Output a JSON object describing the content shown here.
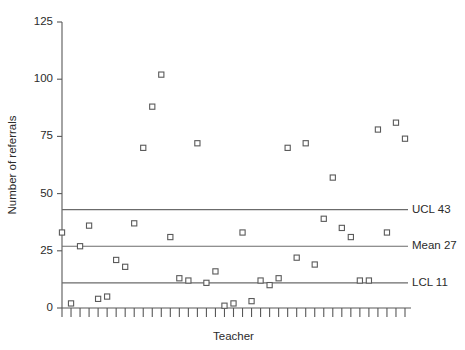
{
  "chart_data": {
    "type": "scatter",
    "title": "",
    "xlabel": "Teacher",
    "ylabel": "Number of referrals",
    "ylim": [
      0,
      125
    ],
    "yticks": [
      0,
      25,
      50,
      75,
      100,
      125
    ],
    "ytick_labels": [
      "0",
      "25",
      "50",
      "75",
      "100",
      "125"
    ],
    "xlim": [
      0,
      40
    ],
    "xticks_count": 39,
    "xtick_labels": [],
    "grid": false,
    "legend": false,
    "series": [
      {
        "name": "Referrals per teacher",
        "marker": "open-square",
        "x": [
          1,
          2,
          3,
          4,
          5,
          6,
          7,
          8,
          9,
          10,
          11,
          12,
          13,
          14,
          15,
          16,
          17,
          18,
          19,
          20,
          21,
          22,
          23,
          24,
          25,
          26,
          27,
          28,
          29,
          30,
          31,
          32,
          33,
          34,
          35,
          36,
          37,
          38,
          39
        ],
        "values": [
          33,
          2,
          27,
          36,
          4,
          5,
          21,
          18,
          37,
          70,
          88,
          102,
          31,
          13,
          12,
          72,
          11,
          16,
          1,
          2,
          33,
          3,
          12,
          10,
          13,
          70,
          22,
          72,
          19,
          39,
          57,
          35,
          31,
          12,
          12,
          78,
          33,
          81,
          74
        ]
      }
    ],
    "control_lines": [
      {
        "id": "ucl",
        "label": "UCL 43",
        "value": 43
      },
      {
        "id": "mean",
        "label": "Mean 27",
        "value": 27
      },
      {
        "id": "lcl",
        "label": "LCL 11",
        "value": 11
      }
    ]
  }
}
